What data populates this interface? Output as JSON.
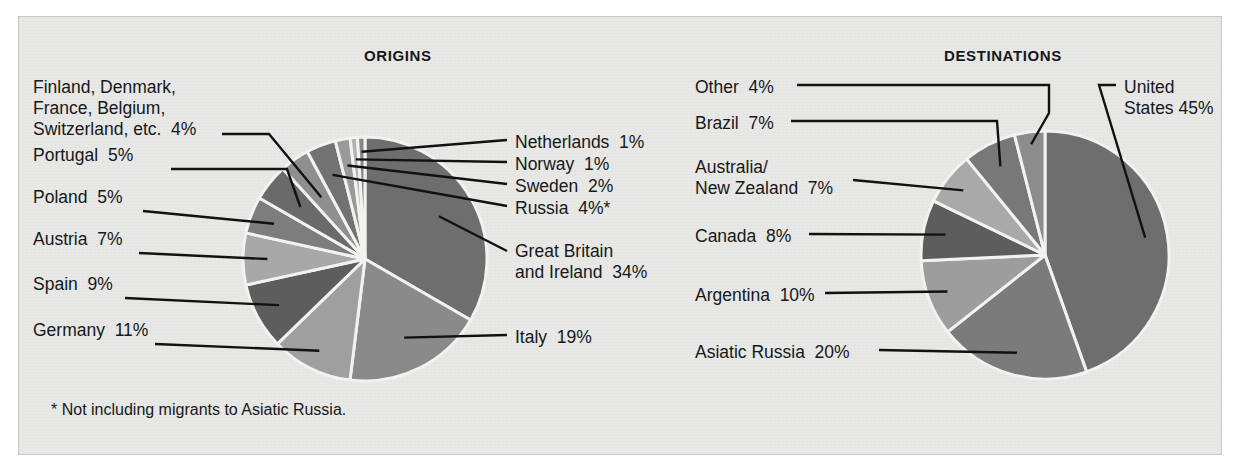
{
  "figure": {
    "background_color": "#e8e8e6",
    "footnote": "* Not including migrants to Asiatic Russia."
  },
  "panels": {
    "origins_title": "ORIGINS",
    "destinations_title": "DESTINATIONS"
  },
  "labels": {
    "origins": {
      "finland_group": "Finland, Denmark,\nFrance, Belgium,\nSwitzerland, etc.  4%",
      "portugal": "Portugal  5%",
      "poland": "Poland  5%",
      "austria": "Austria  7%",
      "spain": "Spain  9%",
      "germany": "Germany  11%",
      "netherlands": "Netherlands  1%",
      "norway": "Norway  1%",
      "sweden": "Sweden  2%",
      "russia": "Russia  4%*",
      "great_britain": "Great Britain\nand Ireland  34%",
      "italy": "Italy  19%"
    },
    "destinations": {
      "other": "Other  4%",
      "brazil": "Brazil  7%",
      "australia_nz": "Australia/\nNew Zealand  7%",
      "canada": "Canada  8%",
      "argentina": "Argentina  10%",
      "asiatic_russia": "Asiatic Russia  20%",
      "united_states": "United\nStates 45%"
    }
  },
  "chart_data": [
    {
      "type": "pie",
      "title": "ORIGINS",
      "id": "origins",
      "unit": "percent",
      "start_angle_deg": -90,
      "direction": "clockwise",
      "note": "* Not including migrants to Asiatic Russia.",
      "categories": [
        "Great Britain and Ireland",
        "Italy",
        "Germany",
        "Spain",
        "Austria",
        "Poland",
        "Portugal",
        "Finland, Denmark, France, Belgium, Switzerland, etc.",
        "Russia",
        "Sweden",
        "Norway",
        "Netherlands"
      ],
      "values": [
        34,
        19,
        11,
        9,
        7,
        5,
        5,
        4,
        4,
        2,
        1,
        1
      ],
      "labels": [
        "Great Britain and Ireland  34%",
        "Italy  19%",
        "Germany  11%",
        "Spain  9%",
        "Austria  7%",
        "Poland  5%",
        "Portugal  5%",
        "Finland, Denmark, France, Belgium, Switzerland, etc.  4%",
        "Russia  4%*",
        "Sweden  2%",
        "Norway  1%",
        "Netherlands  1%"
      ],
      "colors": [
        "#6e6e6e",
        "#8a8a8a",
        "#9f9f9f",
        "#5d5d5d",
        "#a8a8a8",
        "#7d7d7d",
        "#6a6a6a",
        "#8f8f8f",
        "#727272",
        "#9a9a9a",
        "#b2b2b2",
        "#888888"
      ],
      "legend": "leader-lines",
      "grid": false
    },
    {
      "type": "pie",
      "title": "DESTINATIONS",
      "id": "destinations",
      "unit": "percent",
      "start_angle_deg": -90,
      "direction": "clockwise",
      "categories": [
        "United States",
        "Asiatic Russia",
        "Argentina",
        "Canada",
        "Australia/New Zealand",
        "Brazil",
        "Other"
      ],
      "values": [
        45,
        20,
        10,
        8,
        7,
        7,
        4
      ],
      "labels": [
        "United States 45%",
        "Asiatic Russia  20%",
        "Argentina  10%",
        "Canada  8%",
        "Australia/New Zealand  7%",
        "Brazil  7%",
        "Other  4%"
      ],
      "colors": [
        "#6e6e6e",
        "#7b7b7b",
        "#9d9d9d",
        "#5d5d5d",
        "#a9a9a9",
        "#787878",
        "#8c8c8c"
      ],
      "legend": "leader-lines",
      "grid": false
    }
  ]
}
